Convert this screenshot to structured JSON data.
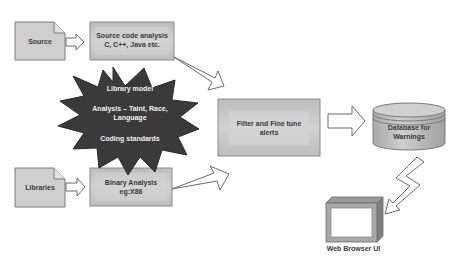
{
  "diagram": {
    "colors": {
      "box_fill": "#c6c6c6",
      "box_inner": "#d4d4d4",
      "box_border": "#8a8a8a",
      "doc_fill": "#cfcfcf",
      "star_fill": "#3a3a3a",
      "arrow_stroke": "#6a6a6a",
      "arrow_fill": "#ffffff",
      "label_dark": "#3a3a3a",
      "label_light": "#f2f2f2"
    },
    "nodes": {
      "source": {
        "label": "Source",
        "shape": "document"
      },
      "libraries": {
        "label": "Libraries",
        "shape": "document"
      },
      "source_analysis": {
        "line1": "Source code analysis",
        "line2": "C, C++, Java etc.",
        "shape": "box"
      },
      "binary_analysis": {
        "line1": "Binary Analysis",
        "line2": "eg:X86",
        "shape": "box"
      },
      "library_star": {
        "shape": "starburst",
        "line1": "Library model",
        "line2": "Analysis – Taint, Race,",
        "line3": "Language",
        "line4": "Coding standards"
      },
      "filter": {
        "line1": "Filter and Fine tune",
        "line2": "alerts",
        "shape": "box"
      },
      "database": {
        "line1": "Database for",
        "line2": "Warnings",
        "shape": "cylinder"
      },
      "browser": {
        "label": "Web Browser UI",
        "shape": "monitor"
      }
    },
    "edges": [
      {
        "from": "source",
        "to": "source_analysis",
        "style": "block-arrow"
      },
      {
        "from": "libraries",
        "to": "binary_analysis",
        "style": "block-arrow"
      },
      {
        "from": "source_analysis",
        "to": "filter",
        "style": "wedge-arrow"
      },
      {
        "from": "binary_analysis",
        "to": "filter",
        "style": "wedge-arrow"
      },
      {
        "from": "filter",
        "to": "database",
        "style": "block-arrow"
      },
      {
        "from": "database",
        "to": "browser",
        "style": "lightning-arrow"
      }
    ]
  }
}
